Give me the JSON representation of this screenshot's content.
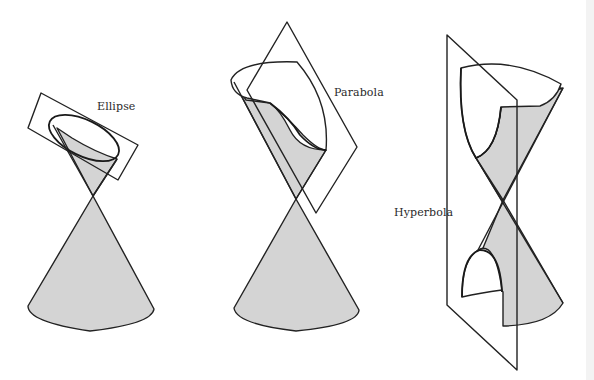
{
  "figure": {
    "type": "conic-sections-diagram",
    "panels": [
      {
        "id": "ellipse",
        "label": "Ellipse"
      },
      {
        "id": "parabola",
        "label": "Parabola"
      },
      {
        "id": "hyperbola",
        "label": "Hyperbola"
      }
    ],
    "colors": {
      "cone_fill": "#d4d4d4",
      "stroke": "#222222",
      "background": "#ffffff"
    }
  }
}
